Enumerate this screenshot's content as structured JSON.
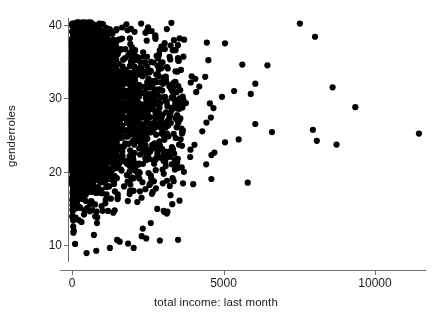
{
  "chart_data": {
    "type": "scatter",
    "title": "",
    "xlabel": "total income: last month",
    "ylabel": "genderroles",
    "xlim": [
      -400,
      11900
    ],
    "ylim": [
      7.2,
      41.5
    ],
    "xticks": [
      0,
      5000,
      10000
    ],
    "xticklabels": [
      "0",
      "5000",
      "10000"
    ],
    "yticks": [
      10,
      20,
      30,
      40
    ],
    "yticklabels": [
      "10",
      "20",
      "30",
      "40"
    ],
    "grid": false,
    "legend": null,
    "marker": "filled-circle",
    "marker_color": "#000000",
    "marker_size_px": 3.1,
    "axis_color": "#6e6e6e",
    "text_color": "#1a1a1a",
    "background": "#ffffff",
    "n_points_approx": 4200,
    "cluster": {
      "x_core_range": [
        0,
        2400
      ],
      "y_core_range": [
        13,
        40
      ],
      "y_mode": 29,
      "solid_black_region_x": [
        0,
        1500
      ]
    },
    "outliers": [
      {
        "x": 3280,
        "y": 40.3
      },
      {
        "x": 3700,
        "y": 38.0
      },
      {
        "x": 4450,
        "y": 37.6
      },
      {
        "x": 5050,
        "y": 37.5
      },
      {
        "x": 4500,
        "y": 35.2
      },
      {
        "x": 5620,
        "y": 34.6
      },
      {
        "x": 7520,
        "y": 40.2
      },
      {
        "x": 8020,
        "y": 38.4
      },
      {
        "x": 6450,
        "y": 34.5
      },
      {
        "x": 6050,
        "y": 32.0
      },
      {
        "x": 5900,
        "y": 30.6
      },
      {
        "x": 5350,
        "y": 31.0
      },
      {
        "x": 4950,
        "y": 30.2
      },
      {
        "x": 4550,
        "y": 29.3
      },
      {
        "x": 4200,
        "y": 31.6
      },
      {
        "x": 3950,
        "y": 33.0
      },
      {
        "x": 3550,
        "y": 30.0
      },
      {
        "x": 8600,
        "y": 31.5
      },
      {
        "x": 9350,
        "y": 28.8
      },
      {
        "x": 7950,
        "y": 25.7
      },
      {
        "x": 8080,
        "y": 24.2
      },
      {
        "x": 8730,
        "y": 23.7
      },
      {
        "x": 11450,
        "y": 25.2
      },
      {
        "x": 6600,
        "y": 25.4
      },
      {
        "x": 6050,
        "y": 26.5
      },
      {
        "x": 5500,
        "y": 24.4
      },
      {
        "x": 5050,
        "y": 24.0
      },
      {
        "x": 4700,
        "y": 22.6
      },
      {
        "x": 4300,
        "y": 25.5
      },
      {
        "x": 3900,
        "y": 22.0
      },
      {
        "x": 3500,
        "y": 20.5
      },
      {
        "x": 4000,
        "y": 18.3
      },
      {
        "x": 4600,
        "y": 19.0
      },
      {
        "x": 5800,
        "y": 18.5
      },
      {
        "x": 3250,
        "y": 16.8
      },
      {
        "x": 3050,
        "y": 14.5
      },
      {
        "x": 2600,
        "y": 13.0
      },
      {
        "x": 2300,
        "y": 11.2
      },
      {
        "x": 1850,
        "y": 10.2
      },
      {
        "x": 1250,
        "y": 9.6
      },
      {
        "x": 800,
        "y": 9.2
      },
      {
        "x": 480,
        "y": 8.9
      },
      {
        "x": 2900,
        "y": 10.6
      },
      {
        "x": 3500,
        "y": 10.7
      },
      {
        "x": 2450,
        "y": 10.9
      }
    ]
  },
  "figure": {
    "alt": "Scatter plot of genderroles versus total income last month"
  }
}
